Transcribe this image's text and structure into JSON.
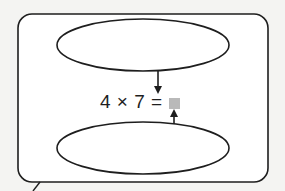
{
  "diagram": {
    "equation": {
      "factor_a": "4",
      "operator": "×",
      "factor_b": "7",
      "equals": "=",
      "unknown_marker": "gray-square"
    },
    "top_oval": {
      "text": ""
    },
    "bottom_oval": {
      "text": ""
    },
    "colors": {
      "stroke": "#1e1e1e",
      "unknown": "#b9b9b9",
      "background": "#f4f4f2"
    }
  }
}
